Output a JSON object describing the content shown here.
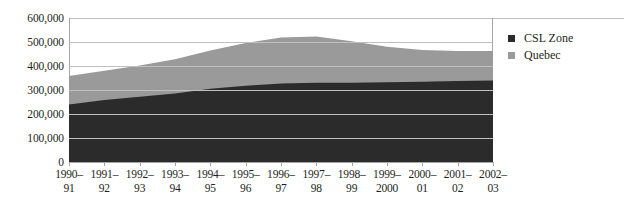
{
  "chart_data": {
    "type": "area",
    "stacked": true,
    "title": "",
    "xlabel": "",
    "ylabel": "",
    "ylim": [
      0,
      600000
    ],
    "ytick_step": 100000,
    "ytick_labels": [
      "600,000",
      "500,000",
      "400,000",
      "300,000",
      "200,000",
      "100,000",
      "0"
    ],
    "ytick_values": [
      600000,
      500000,
      400000,
      300000,
      200000,
      100000,
      0
    ],
    "grid": true,
    "legend_position": "right",
    "categories": [
      "1990–91",
      "1991–92",
      "1992–93",
      "1993–94",
      "1994–95",
      "1995–96",
      "1996–97",
      "1997–98",
      "1998–99",
      "1999–2000",
      "2000–01",
      "2001–02",
      "2002–03"
    ],
    "category_lines": [
      [
        "1990–",
        "91"
      ],
      [
        "1991–",
        "92"
      ],
      [
        "1992–",
        "93"
      ],
      [
        "1993–",
        "94"
      ],
      [
        "1994–",
        "95"
      ],
      [
        "1995–",
        "96"
      ],
      [
        "1996–",
        "97"
      ],
      [
        "1997–",
        "98"
      ],
      [
        "1998–",
        "99"
      ],
      [
        "1999–",
        "2000"
      ],
      [
        "2000–",
        "01"
      ],
      [
        "2001–",
        "02"
      ],
      [
        "2002–",
        "03"
      ]
    ],
    "series": [
      {
        "name": "CSL Zone",
        "color": "#2b2b2b",
        "values": [
          240000,
          258000,
          272000,
          285000,
          305000,
          318000,
          327000,
          330000,
          330000,
          332000,
          334000,
          337000,
          340000
        ]
      },
      {
        "name": "Quebec",
        "color": "#9a9a9a",
        "values": [
          118000,
          122000,
          130000,
          143000,
          160000,
          178000,
          192000,
          193000,
          173000,
          148000,
          133000,
          126000,
          122000
        ]
      }
    ],
    "totals": [
      358000,
      380000,
      402000,
      428000,
      465000,
      496000,
      519000,
      523000,
      503000,
      480000,
      467000,
      463000,
      462000
    ]
  },
  "legend": {
    "items": [
      {
        "label": "CSL Zone",
        "color": "#2b2b2b"
      },
      {
        "label": "Quebec",
        "color": "#9a9a9a"
      }
    ]
  },
  "colors": {
    "csl_zone": "#2b2b2b",
    "quebec": "#9a9a9a",
    "gridline": "#bfbfbf",
    "axis": "#a6a6a6",
    "text": "#231f20",
    "background": "#ffffff"
  }
}
